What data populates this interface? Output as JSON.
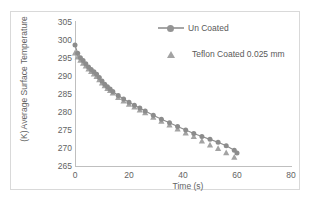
{
  "chart_data": {
    "type": "line",
    "title": "",
    "xlabel": "Time (s)",
    "ylabel_line1": "Average Surface Temperature",
    "ylabel_line2": "(K)",
    "xlim": [
      0,
      80
    ],
    "ylim": [
      265,
      305
    ],
    "xticks": [
      0,
      20,
      40,
      60,
      80
    ],
    "yticks": [
      265,
      270,
      275,
      280,
      285,
      290,
      295,
      300,
      305
    ],
    "grid": false,
    "legend_position": "upper-right-inside",
    "series": [
      {
        "name": "Un Coated",
        "marker": "circle",
        "line": true,
        "color": "#8c8c8c",
        "x": [
          0,
          1,
          2,
          3,
          4,
          5,
          6,
          7,
          8,
          9,
          10,
          11,
          12,
          13,
          14,
          16,
          18,
          20,
          22,
          24,
          26,
          29,
          32,
          35,
          38,
          41,
          44,
          47,
          50,
          53,
          56,
          59,
          60
        ],
        "y": [
          298.6,
          296.3,
          295.1,
          294.3,
          293.4,
          292.5,
          291.8,
          291.2,
          290.5,
          289.6,
          288.6,
          287.7,
          287.0,
          286.4,
          285.7,
          284.6,
          283.6,
          282.7,
          281.9,
          281.1,
          280.3,
          279.1,
          278.0,
          277.0,
          276.0,
          275.0,
          274.0,
          273.2,
          272.4,
          271.6,
          270.6,
          269.4,
          268.6
        ]
      },
      {
        "name": "Teflon Coated 0.025 mm",
        "marker": "triangle",
        "line": false,
        "color": "#a3a3a3",
        "x": [
          0,
          1,
          2,
          3,
          4,
          5,
          6,
          7,
          8,
          9,
          10,
          11,
          12,
          13,
          14,
          16,
          18,
          20,
          22,
          24,
          26,
          29,
          32,
          35,
          38,
          41,
          44,
          47,
          50,
          53,
          56,
          59
        ],
        "y": [
          296.4,
          295.3,
          294.4,
          293.6,
          292.8,
          292.0,
          291.3,
          290.6,
          289.9,
          289.0,
          288.1,
          287.3,
          286.6,
          286.0,
          285.3,
          284.1,
          283.1,
          282.2,
          281.4,
          280.6,
          279.8,
          278.6,
          277.5,
          276.4,
          275.3,
          274.2,
          273.2,
          272.0,
          270.9,
          269.9,
          268.7,
          267.5
        ]
      }
    ]
  },
  "axis": {
    "x_title": "Time (s)",
    "y_title_line1": "Average Surface Temperature",
    "y_title_line2": "(K)",
    "xticks": [
      "0",
      "20",
      "40",
      "60",
      "80"
    ],
    "yticks": [
      "305",
      "300",
      "295",
      "290",
      "285",
      "280",
      "275",
      "270",
      "265"
    ]
  },
  "legend": {
    "items": [
      {
        "label": "Un Coated",
        "marker": "circle-line-marker"
      },
      {
        "label": "Teflon Coated 0.025 mm",
        "marker": "triangle-marker"
      }
    ]
  },
  "colors": {
    "series_uncoated": "#8c8c8c",
    "series_teflon": "#a3a3a3",
    "axis": "#bfbfbf",
    "text": "#636363",
    "frame": "#d9d9d9"
  }
}
